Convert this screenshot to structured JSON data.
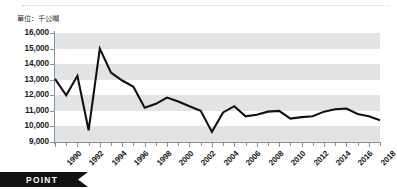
{
  "unit_label": "單位：千公噸",
  "banner": {
    "label": "POINT",
    "bg_color": "#111111",
    "text_color": "#ffffff"
  },
  "style": {
    "line_color": "#111111",
    "band_color": "#e2e3e5",
    "axis_color": "#8d9097",
    "plot_bg": "#ffffff"
  },
  "chart_data": {
    "type": "line",
    "title": "",
    "subtitle": "",
    "xlabel": "",
    "ylabel": "單位：千公噸",
    "grid": "horizontal-bands",
    "legend": "none",
    "ylim": [
      9000,
      16000
    ],
    "ytick_step": 1000,
    "ytick_labels": [
      "16,000",
      "15,000",
      "14,000",
      "13,000",
      "12,000",
      "11,000",
      "10,000",
      "9,000"
    ],
    "ytick_values": [
      16000,
      15000,
      14000,
      13000,
      12000,
      11000,
      10000,
      9000
    ],
    "xlim": [
      1990,
      2019
    ],
    "xtick_labels": [
      "1990",
      "1992",
      "1994",
      "1996",
      "1998",
      "2000",
      "2002",
      "2004",
      "2006",
      "2008",
      "2010",
      "2012",
      "2014",
      "2016",
      "2018"
    ],
    "xtick_values": [
      1990,
      1992,
      1994,
      1996,
      1998,
      2000,
      2002,
      2004,
      2006,
      2008,
      2010,
      2012,
      2014,
      2016,
      2018
    ],
    "x": [
      1990,
      1991,
      1992,
      1993,
      1994,
      1995,
      1996,
      1997,
      1998,
      1999,
      2000,
      2001,
      2002,
      2003,
      2004,
      2005,
      2006,
      2007,
      2008,
      2009,
      2010,
      2011,
      2012,
      2013,
      2014,
      2015,
      2016,
      2017,
      2018,
      2019
    ],
    "values": [
      13050,
      12000,
      13250,
      9750,
      15000,
      13450,
      12950,
      12550,
      11200,
      11450,
      11850,
      11600,
      11300,
      11000,
      9650,
      10900,
      11300,
      10650,
      10750,
      10950,
      11000,
      10500,
      10600,
      10650,
      10950,
      11100,
      11150,
      10800,
      10650,
      10400
    ],
    "series": [
      {
        "name": "",
        "values": [
          13050,
          12000,
          13250,
          9750,
          15000,
          13450,
          12950,
          12550,
          11200,
          11450,
          11850,
          11600,
          11300,
          11000,
          9650,
          10900,
          11300,
          10650,
          10750,
          10950,
          11000,
          10500,
          10600,
          10650,
          10950,
          11100,
          11150,
          10800,
          10650,
          10400
        ]
      }
    ],
    "annotations": []
  }
}
